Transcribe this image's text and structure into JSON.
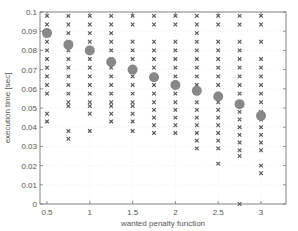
{
  "chart_data": {
    "type": "scatter",
    "title": "",
    "xlabel": "wanted penalty function",
    "ylabel": "execution time [sec]",
    "xlim": [
      0.4,
      3.25
    ],
    "ylim": [
      0,
      0.1
    ],
    "xticks": [
      0.5,
      1,
      1.5,
      2,
      2.5,
      3
    ],
    "xtick_labels": [
      "0.5",
      "1",
      "1.5",
      "2",
      "2.5",
      "3"
    ],
    "yticks": [
      0,
      0.01,
      0.02,
      0.03,
      0.04,
      0.05,
      0.06,
      0.07,
      0.08,
      0.09,
      0.1
    ],
    "ytick_labels": [
      "0",
      "0.01",
      "0.02",
      "0.03",
      "0.04",
      "0.05",
      "0.06",
      "0.07",
      "0.08",
      "0.09",
      "0.1"
    ],
    "grid": true,
    "legend": null,
    "series": [
      {
        "name": "samples",
        "marker": "x",
        "color": "#555555",
        "points": [
          [
            0.5,
            0.098
          ],
          [
            0.5,
            0.0935
          ],
          [
            0.5,
            0.089
          ],
          [
            0.5,
            0.0845
          ],
          [
            0.5,
            0.08
          ],
          [
            0.5,
            0.0755
          ],
          [
            0.5,
            0.071
          ],
          [
            0.5,
            0.0665
          ],
          [
            0.5,
            0.062
          ],
          [
            0.5,
            0.0575
          ],
          [
            0.5,
            0.047
          ],
          [
            0.5,
            0.043
          ],
          [
            0.75,
            0.098
          ],
          [
            0.75,
            0.0935
          ],
          [
            0.75,
            0.089
          ],
          [
            0.75,
            0.0845
          ],
          [
            0.75,
            0.08
          ],
          [
            0.75,
            0.0755
          ],
          [
            0.75,
            0.071
          ],
          [
            0.75,
            0.0665
          ],
          [
            0.75,
            0.062
          ],
          [
            0.75,
            0.0575
          ],
          [
            0.75,
            0.053
          ],
          [
            0.75,
            0.051
          ],
          [
            0.75,
            0.038
          ],
          [
            0.75,
            0.034
          ],
          [
            1.0,
            0.098
          ],
          [
            1.0,
            0.0935
          ],
          [
            1.0,
            0.089
          ],
          [
            1.0,
            0.0845
          ],
          [
            1.0,
            0.08
          ],
          [
            1.0,
            0.0755
          ],
          [
            1.0,
            0.071
          ],
          [
            1.0,
            0.0665
          ],
          [
            1.0,
            0.062
          ],
          [
            1.0,
            0.0575
          ],
          [
            1.0,
            0.053
          ],
          [
            1.0,
            0.051
          ],
          [
            1.0,
            0.047
          ],
          [
            1.0,
            0.038
          ],
          [
            1.25,
            0.098
          ],
          [
            1.25,
            0.0935
          ],
          [
            1.25,
            0.089
          ],
          [
            1.25,
            0.0845
          ],
          [
            1.25,
            0.08
          ],
          [
            1.25,
            0.0755
          ],
          [
            1.25,
            0.071
          ],
          [
            1.25,
            0.0665
          ],
          [
            1.25,
            0.062
          ],
          [
            1.25,
            0.0575
          ],
          [
            1.25,
            0.053
          ],
          [
            1.25,
            0.051
          ],
          [
            1.25,
            0.047
          ],
          [
            1.25,
            0.043
          ],
          [
            1.5,
            0.098
          ],
          [
            1.5,
            0.0935
          ],
          [
            1.5,
            0.0845
          ],
          [
            1.5,
            0.08
          ],
          [
            1.5,
            0.0755
          ],
          [
            1.5,
            0.071
          ],
          [
            1.5,
            0.0665
          ],
          [
            1.5,
            0.062
          ],
          [
            1.5,
            0.0575
          ],
          [
            1.5,
            0.053
          ],
          [
            1.5,
            0.051
          ],
          [
            1.5,
            0.047
          ],
          [
            1.5,
            0.043
          ],
          [
            1.5,
            0.038
          ],
          [
            1.75,
            0.098
          ],
          [
            1.75,
            0.0935
          ],
          [
            1.75,
            0.0845
          ],
          [
            1.75,
            0.08
          ],
          [
            1.75,
            0.0755
          ],
          [
            1.75,
            0.071
          ],
          [
            1.75,
            0.0665
          ],
          [
            1.75,
            0.062
          ],
          [
            1.75,
            0.0575
          ],
          [
            1.75,
            0.053
          ],
          [
            1.75,
            0.049
          ],
          [
            1.75,
            0.045
          ],
          [
            1.75,
            0.041
          ],
          [
            1.75,
            0.037
          ],
          [
            2.0,
            0.098
          ],
          [
            2.0,
            0.0935
          ],
          [
            2.0,
            0.0845
          ],
          [
            2.0,
            0.08
          ],
          [
            2.0,
            0.0755
          ],
          [
            2.0,
            0.071
          ],
          [
            2.0,
            0.0665
          ],
          [
            2.0,
            0.062
          ],
          [
            2.0,
            0.0575
          ],
          [
            2.0,
            0.053
          ],
          [
            2.0,
            0.049
          ],
          [
            2.0,
            0.045
          ],
          [
            2.0,
            0.041
          ],
          [
            2.0,
            0.037
          ],
          [
            2.25,
            0.098
          ],
          [
            2.25,
            0.0935
          ],
          [
            2.25,
            0.089
          ],
          [
            2.25,
            0.0845
          ],
          [
            2.25,
            0.08
          ],
          [
            2.25,
            0.0755
          ],
          [
            2.25,
            0.071
          ],
          [
            2.25,
            0.0665
          ],
          [
            2.25,
            0.062
          ],
          [
            2.25,
            0.0575
          ],
          [
            2.25,
            0.053
          ],
          [
            2.25,
            0.049
          ],
          [
            2.25,
            0.045
          ],
          [
            2.25,
            0.041
          ],
          [
            2.25,
            0.037
          ],
          [
            2.25,
            0.033
          ],
          [
            2.25,
            0.029
          ],
          [
            2.5,
            0.098
          ],
          [
            2.5,
            0.0935
          ],
          [
            2.5,
            0.0845
          ],
          [
            2.5,
            0.08
          ],
          [
            2.5,
            0.0755
          ],
          [
            2.5,
            0.071
          ],
          [
            2.5,
            0.0665
          ],
          [
            2.5,
            0.062
          ],
          [
            2.5,
            0.0575
          ],
          [
            2.5,
            0.053
          ],
          [
            2.5,
            0.049
          ],
          [
            2.5,
            0.045
          ],
          [
            2.5,
            0.041
          ],
          [
            2.5,
            0.037
          ],
          [
            2.5,
            0.033
          ],
          [
            2.5,
            0.029
          ],
          [
            2.5,
            0.021
          ],
          [
            2.75,
            0.098
          ],
          [
            2.75,
            0.0935
          ],
          [
            2.75,
            0.0845
          ],
          [
            2.75,
            0.08
          ],
          [
            2.75,
            0.0755
          ],
          [
            2.75,
            0.071
          ],
          [
            2.75,
            0.0665
          ],
          [
            2.75,
            0.062
          ],
          [
            2.75,
            0.0575
          ],
          [
            2.75,
            0.048
          ],
          [
            2.75,
            0.044
          ],
          [
            2.75,
            0.04
          ],
          [
            2.75,
            0.036
          ],
          [
            2.75,
            0.032
          ],
          [
            2.75,
            0.028
          ],
          [
            2.75,
            0.025
          ],
          [
            2.75,
            0.0
          ],
          [
            3.0,
            0.098
          ],
          [
            3.0,
            0.0935
          ],
          [
            3.0,
            0.0845
          ],
          [
            3.0,
            0.0755
          ],
          [
            3.0,
            0.071
          ],
          [
            3.0,
            0.0665
          ],
          [
            3.0,
            0.062
          ],
          [
            3.0,
            0.0575
          ],
          [
            3.0,
            0.053
          ],
          [
            3.0,
            0.048
          ],
          [
            3.0,
            0.044
          ],
          [
            3.0,
            0.04
          ],
          [
            3.0,
            0.036
          ],
          [
            3.0,
            0.032
          ],
          [
            3.0,
            0.028
          ],
          [
            3.0,
            0.02
          ],
          [
            3.0,
            0.016
          ]
        ]
      },
      {
        "name": "mean",
        "marker": "o",
        "color": "#888888",
        "points": [
          [
            0.5,
            0.089
          ],
          [
            0.75,
            0.083
          ],
          [
            1.0,
            0.08
          ],
          [
            1.25,
            0.074
          ],
          [
            1.5,
            0.07
          ],
          [
            1.75,
            0.066
          ],
          [
            2.0,
            0.062
          ],
          [
            2.25,
            0.059
          ],
          [
            2.5,
            0.056
          ],
          [
            2.75,
            0.052
          ],
          [
            3.0,
            0.046
          ]
        ]
      }
    ]
  },
  "colors": {
    "axis": "#666666",
    "grid": "#e4e4e4",
    "marker_x": "#555555",
    "marker_circle": "#8a8a8a",
    "text": "#555555"
  }
}
